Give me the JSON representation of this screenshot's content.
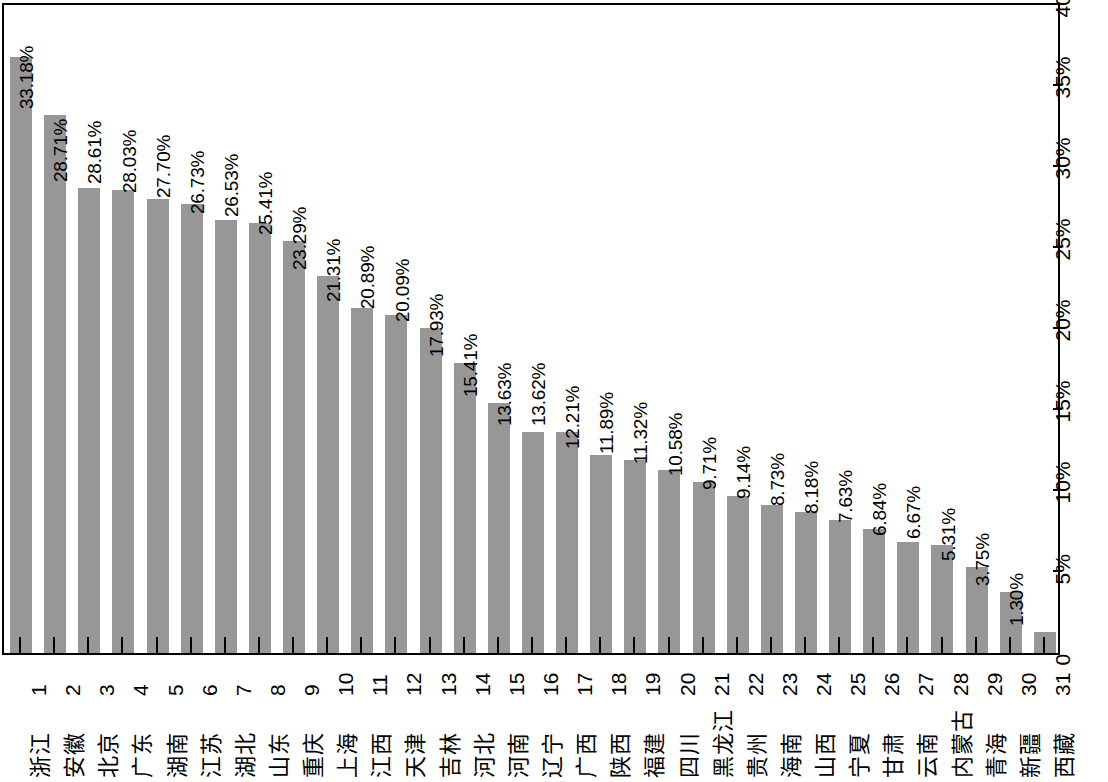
{
  "chart_data": {
    "type": "bar",
    "title": "",
    "subtitle": "",
    "xlabel": "",
    "ylabel": "",
    "orientation": "vertical-bars-page-rotated-90ccw",
    "grid": false,
    "legend": null,
    "ylim": [
      0,
      40
    ],
    "ytick_labels": [
      "0",
      "5%",
      "10%",
      "15%",
      "20%",
      "25%",
      "30%",
      "35%",
      "40%"
    ],
    "ytick_values": [
      0,
      5,
      10,
      15,
      20,
      25,
      30,
      35,
      40
    ],
    "categories": [
      "浙江",
      "安徽",
      "北京",
      "广东",
      "湖南",
      "江苏",
      "湖北",
      "山东",
      "重庆",
      "上海",
      "江西",
      "天津",
      "吉林",
      "河北",
      "河南",
      "辽宁",
      "广西",
      "陕西",
      "福建",
      "四川",
      "黑龙江",
      "贵州",
      "海南",
      "山西",
      "宁夏",
      "甘肃",
      "云南",
      "内蒙古",
      "青海",
      "新疆",
      "西藏"
    ],
    "index_labels": [
      "1",
      "2",
      "3",
      "4",
      "5",
      "6",
      "7",
      "8",
      "9",
      "10",
      "11",
      "12",
      "13",
      "14",
      "15",
      "16",
      "17",
      "18",
      "19",
      "20",
      "21",
      "22",
      "23",
      "24",
      "25",
      "26",
      "27",
      "28",
      "29",
      "30",
      "31"
    ],
    "values": [
      36.78,
      33.18,
      28.71,
      28.61,
      28.03,
      27.7,
      26.73,
      26.53,
      25.41,
      23.29,
      21.31,
      20.89,
      20.09,
      17.93,
      15.41,
      13.63,
      13.62,
      12.21,
      11.89,
      11.32,
      10.58,
      9.71,
      9.14,
      8.73,
      8.18,
      7.63,
      6.84,
      6.67,
      5.31,
      3.75,
      1.3
    ],
    "value_labels": [
      "36.78%",
      "33.18%",
      "28.71%",
      "28.61%",
      "28.03%",
      "27.70%",
      "26.73%",
      "26.53%",
      "25.41%",
      "23.29%",
      "21.31%",
      "20.89%",
      "20.09%",
      "17.93%",
      "15.41%",
      "13.63%",
      "13.62%",
      "12.21%",
      "11.89%",
      "11.32%",
      "10.58%",
      "9.71%",
      "9.14%",
      "8.73%",
      "8.18%",
      "7.63%",
      "6.84%",
      "6.67%",
      "5.31%",
      "3.75%",
      "1.30%"
    ],
    "colors": {
      "bar": "#979797",
      "axis": "#000000",
      "text": "#000000",
      "background": "#ffffff"
    }
  }
}
